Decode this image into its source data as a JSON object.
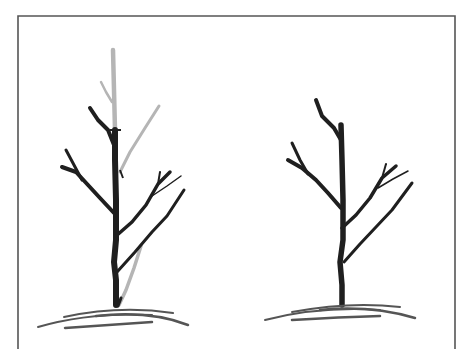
{
  "figure": {
    "type": "illustration",
    "colors": {
      "frame": "#555555",
      "kept_branches": "#1f1f1f",
      "pruned_branches": "#b5b5b5",
      "ground": "#555555",
      "background": "#ffffff"
    },
    "panels": [
      {
        "id": "before",
        "description": "Tree with branches to be removed shown in light gray"
      },
      {
        "id": "after",
        "description": "Same tree after pruning, only dark branches remain"
      }
    ]
  }
}
